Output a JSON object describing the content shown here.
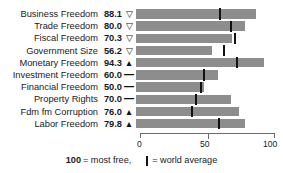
{
  "chart_data": {
    "type": "bar",
    "orientation": "horizontal",
    "title": "",
    "xlabel": "",
    "ylabel": "",
    "xlim": [
      0,
      100
    ],
    "grid": false,
    "legend_position": "bottom",
    "axis_ticks": [
      "0",
      "50",
      "100"
    ],
    "axis_tick_values": [
      0,
      50,
      100
    ],
    "categories": [
      "Business Freedom",
      "Trade Freedom",
      "Fiscal Freedom",
      "Government Size",
      "Monetary Freedom",
      "Investment Freedom",
      "Financial Freedom",
      "Property Rights",
      "Fdm fm Corruption",
      "Labor Freedom"
    ],
    "values": [
      88.1,
      80.0,
      70.3,
      56.2,
      94.3,
      60.0,
      50.0,
      70.0,
      76.0,
      79.8
    ],
    "value_labels": [
      "88.1",
      "80.0",
      "70.3",
      "56.2",
      "94.3",
      "60.0",
      "50.0",
      "70.0",
      "76.0",
      "79.8"
    ],
    "trend_indicators": [
      "down",
      "down",
      "down",
      "down",
      "up",
      "flat",
      "flat",
      "flat",
      "up",
      "up"
    ],
    "trend_glyphs": [
      "▽",
      "▽",
      "▽",
      "▽",
      "▲",
      "—",
      "—",
      "—",
      "▲",
      "▲"
    ],
    "world_average": [
      62,
      70,
      73,
      65,
      74,
      50,
      48,
      44,
      41,
      61
    ],
    "series": [
      {
        "name": "Country score",
        "values": [
          88.1,
          80.0,
          70.3,
          56.2,
          94.3,
          60.0,
          50.0,
          70.0,
          76.0,
          79.8
        ]
      },
      {
        "name": "World average",
        "values": [
          62,
          70,
          73,
          65,
          74,
          50,
          48,
          44,
          41,
          61
        ]
      }
    ],
    "colors": {
      "bar": "#8d8d8d",
      "world_average_marker": "#111111",
      "axis": "#6a6a6a",
      "text": "#1a1a1a",
      "background": "#ffffff"
    }
  },
  "rows": [
    {
      "label": "Business Freedom",
      "value": "88.1",
      "indicator": "▽",
      "indicator_type": "down"
    },
    {
      "label": "Trade Freedom",
      "value": "80.0",
      "indicator": "▽",
      "indicator_type": "down"
    },
    {
      "label": "Fiscal Freedom",
      "value": "70.3",
      "indicator": "▽",
      "indicator_type": "down"
    },
    {
      "label": "Government Size",
      "value": "56.2",
      "indicator": "▽",
      "indicator_type": "down"
    },
    {
      "label": "Monetary Freedom",
      "value": "94.3",
      "indicator": "▲",
      "indicator_type": "up"
    },
    {
      "label": "Investment Freedom",
      "value": "60.0",
      "indicator": "—",
      "indicator_type": "flat"
    },
    {
      "label": "Financial Freedom",
      "value": "50.0",
      "indicator": "—",
      "indicator_type": "flat"
    },
    {
      "label": "Property Rights",
      "value": "70.0",
      "indicator": "—",
      "indicator_type": "flat"
    },
    {
      "label": "Fdm fm Corruption",
      "value": "76.0",
      "indicator": "▲",
      "indicator_type": "up"
    },
    {
      "label": "Labor Freedom",
      "value": "79.8",
      "indicator": "▲",
      "indicator_type": "up"
    }
  ],
  "axis": {
    "tick_0": "0",
    "tick_50": "50",
    "tick_100": "100"
  },
  "footnote": {
    "most_free_number": "100",
    "most_free_text": "= most free,",
    "world_average_text": "= world average"
  },
  "title_remnant": ""
}
